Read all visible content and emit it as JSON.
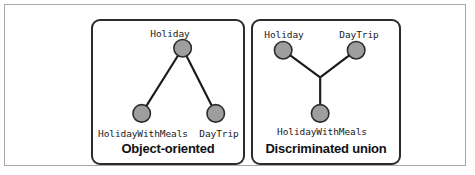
{
  "figure": {
    "background_color": "#ffffff",
    "frame_color": "#a8a8a8",
    "panel_border_color": "#2b2b2b",
    "node_fill_color": "#9e9e9e",
    "node_stroke_color": "#2b2b2b",
    "edge_color": "#1a1a1a"
  },
  "panels": [
    {
      "id": "object-oriented",
      "caption": "Object-oriented",
      "nodes": [
        {
          "id": "holiday",
          "label": "Holiday",
          "cx": 92,
          "cy": 28,
          "r": 9,
          "label_x": 92,
          "label_y": 10
        },
        {
          "id": "holiday-with-meals",
          "label": "HolidayWithMeals",
          "cx": 50,
          "cy": 95,
          "r": 9,
          "label_x": 50,
          "label_y": 112
        },
        {
          "id": "day-trip",
          "label": "DayTrip",
          "cx": 126,
          "cy": 95,
          "r": 9,
          "label_x": 126,
          "label_y": 112
        }
      ],
      "edges": [
        {
          "from": "holiday",
          "to": "holiday-with-meals"
        },
        {
          "from": "holiday",
          "to": "day-trip"
        }
      ]
    },
    {
      "id": "discriminated-union",
      "caption": "Discriminated union",
      "nodes": [
        {
          "id": "holiday",
          "label": "Holiday",
          "cx": 31,
          "cy": 30,
          "r": 9,
          "label_x": 31,
          "label_y": 11
        },
        {
          "id": "day-trip",
          "label": "DayTrip",
          "cx": 106,
          "cy": 30,
          "r": 9,
          "label_x": 106,
          "label_y": 11
        },
        {
          "id": "holiday-with-meals",
          "label": "HolidayWithMeals",
          "cx": 69,
          "cy": 95,
          "r": 9,
          "label_x": 69,
          "label_y": 110
        }
      ],
      "junction": {
        "x": 69,
        "y": 58
      },
      "edges": [
        {
          "from": "holiday",
          "to": "junction"
        },
        {
          "from": "day-trip",
          "to": "junction"
        },
        {
          "from": "junction",
          "to": "holiday-with-meals"
        }
      ]
    }
  ]
}
